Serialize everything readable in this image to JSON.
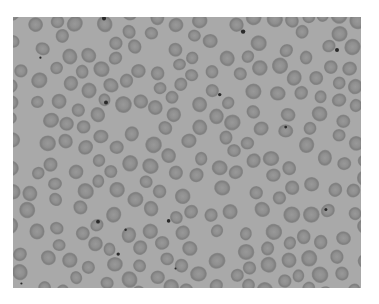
{
  "image": {
    "subject": "blood smear micrograph, red blood cells",
    "frame": {
      "x": 13,
      "y": 17,
      "width": 348,
      "height": 271
    },
    "colors": {
      "page_background": "#ffffff",
      "slide_background": "#a9a9a9",
      "cell_rim": "#858585",
      "cell_center": "#979797",
      "dot": "#2a2a2a"
    },
    "cell_count_approx": 230,
    "dark_dot_count_approx": 14
  }
}
